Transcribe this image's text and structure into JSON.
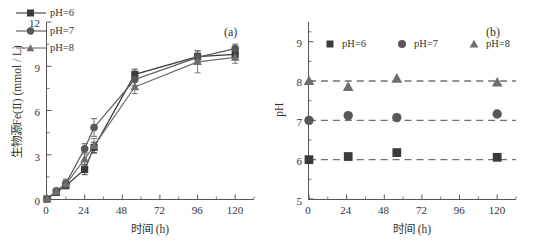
{
  "figure": {
    "panel_a_tag": "(a)",
    "panel_b_tag": "(b)",
    "series_colors": {
      "pH6": "#3a3a3a",
      "pH7": "#585858",
      "pH8": "#6e6e6e",
      "axis": "#555555",
      "dashed_guide": "#707070"
    }
  },
  "chart_data": [
    {
      "type": "line",
      "panel": "(a)",
      "title": "",
      "xlabel": "时间 (h)",
      "ylabel": "生物源Fe(Ⅱ) (mmol / L)",
      "xlim": [
        0,
        132
      ],
      "ylim": [
        0,
        12
      ],
      "xticks": [
        0,
        24,
        48,
        72,
        96,
        120
      ],
      "yticks": [
        0,
        3,
        6,
        9,
        12
      ],
      "grid": false,
      "legend_position": "top-left",
      "error_bars": true,
      "x": [
        0,
        6,
        12,
        24,
        30,
        56,
        96,
        120
      ],
      "series": [
        {
          "name": "pH=6",
          "marker": "square",
          "values": [
            0.0,
            0.45,
            0.9,
            2.0,
            3.5,
            8.45,
            9.65,
            9.8
          ],
          "errors": [
            0.0,
            0.1,
            0.15,
            0.35,
            0.35,
            0.35,
            0.4,
            0.35
          ]
        },
        {
          "name": "pH=7",
          "marker": "circle",
          "values": [
            0.0,
            0.55,
            1.05,
            3.4,
            4.85,
            8.1,
            9.6,
            10.2
          ],
          "errors": [
            0.0,
            0.1,
            0.3,
            0.35,
            0.6,
            0.4,
            0.3,
            0.3
          ]
        },
        {
          "name": "pH=8",
          "marker": "triangle",
          "values": [
            0.0,
            0.5,
            1.0,
            2.7,
            3.6,
            7.6,
            9.3,
            9.6
          ],
          "errors": [
            0.0,
            0.1,
            0.25,
            0.45,
            0.5,
            0.45,
            0.75,
            0.4
          ]
        }
      ]
    },
    {
      "type": "scatter",
      "panel": "(b)",
      "title": "",
      "xlabel": "时间 (h)",
      "ylabel": "pH",
      "xlim": [
        0,
        132
      ],
      "ylim": [
        5,
        9.5
      ],
      "xticks": [
        0,
        24,
        48,
        72,
        96,
        120
      ],
      "yticks": [
        5,
        6,
        7,
        8,
        9
      ],
      "grid": false,
      "legend_position": "top-left",
      "guide_lines": [
        6,
        7,
        8
      ],
      "x": [
        0,
        25,
        56,
        120
      ],
      "series": [
        {
          "name": "pH=6",
          "marker": "square",
          "values": [
            6.0,
            6.08,
            6.18,
            6.06
          ]
        },
        {
          "name": "pH=7",
          "marker": "circle",
          "values": [
            7.0,
            7.12,
            7.07,
            7.16
          ]
        },
        {
          "name": "pH=8",
          "marker": "triangle",
          "values": [
            8.0,
            7.85,
            8.06,
            7.96
          ]
        }
      ]
    }
  ],
  "panel_a": {
    "tag": "(a)",
    "xtitle": "时间 (h)",
    "ytitle": "生物源Fe(Ⅱ) (mmol / L)",
    "yticks": [
      "0",
      "3",
      "6",
      "9",
      "12"
    ],
    "xticks": [
      "0",
      "24",
      "48",
      "72",
      "96",
      "120"
    ],
    "legend": [
      {
        "label": "pH=6"
      },
      {
        "label": "pH=7"
      },
      {
        "label": "pH=8"
      }
    ]
  },
  "panel_b": {
    "tag": "(b)",
    "xtitle": "时间 (h)",
    "ytitle": "pH",
    "yticks": [
      "5",
      "6",
      "7",
      "8",
      "9"
    ],
    "xticks": [
      "0",
      "24",
      "48",
      "72",
      "96",
      "120"
    ],
    "legend": [
      {
        "label": "pH=6"
      },
      {
        "label": "pH=7"
      },
      {
        "label": "pH=8"
      }
    ]
  }
}
